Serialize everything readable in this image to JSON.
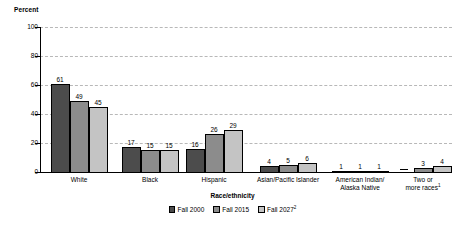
{
  "chart_data": {
    "type": "bar",
    "title": "",
    "ylabel": "Percent",
    "xlabel": "Race/ethnicity",
    "ylim": [
      0,
      100
    ],
    "yticks": [
      0,
      20,
      40,
      60,
      80,
      100
    ],
    "grid": "horizontal-dashed",
    "legend_position": "bottom-center",
    "categories": [
      "White",
      "Black",
      "Hispanic",
      "Asian/Pacific Islander",
      "American Indian/\nAlaska Native",
      "Two or\nmore races"
    ],
    "series": [
      {
        "name": "Fall 2000",
        "color": "#4c4c4c",
        "values": [
          61,
          17,
          16,
          4,
          1,
          null
        ]
      },
      {
        "name": "Fall 2015",
        "color": "#8c8c8c",
        "values": [
          49,
          15,
          26,
          5,
          1,
          3
        ]
      },
      {
        "name": "Fall 2027",
        "color": "#c4c4c4",
        "values": [
          45,
          15,
          29,
          6,
          1,
          4
        ]
      }
    ],
    "data_labels": [
      [
        "61",
        "49",
        "45"
      ],
      [
        "17",
        "15",
        "15"
      ],
      [
        "16",
        "26",
        "29"
      ],
      [
        "4",
        "5",
        "6"
      ],
      [
        "1",
        "1",
        "1"
      ],
      [
        "—",
        "3",
        "4"
      ]
    ],
    "null_marker": "—"
  },
  "axes": {
    "y_title": "Percent",
    "x_title": "Race/ethnicity",
    "y_tick_labels": [
      "100",
      "80",
      "60",
      "40",
      "20",
      "0"
    ]
  },
  "groups": [
    {
      "label": "White",
      "label_sup": ""
    },
    {
      "label": "Black",
      "label_sup": ""
    },
    {
      "label": "Hispanic",
      "label_sup": ""
    },
    {
      "label": "Asian/Pacific Islander",
      "label_sup": ""
    },
    {
      "label": "American Indian/\nAlaska Native",
      "label_sup": ""
    },
    {
      "label": "Two or\nmore races",
      "label_sup": "1"
    }
  ],
  "legend": {
    "items": [
      {
        "label": "Fall 2000",
        "sup": "",
        "color": "#4c4c4c"
      },
      {
        "label": "Fall 2015",
        "sup": "",
        "color": "#8c8c8c"
      },
      {
        "label": "Fall 2027",
        "sup": "2",
        "color": "#c4c4c4"
      }
    ]
  },
  "colors": {
    "series_0": "#4c4c4c",
    "series_1": "#8c8c8c",
    "series_2": "#c4c4c4",
    "axis": "#000000",
    "gridline": "#b8b8b8",
    "background": "#ffffff"
  }
}
